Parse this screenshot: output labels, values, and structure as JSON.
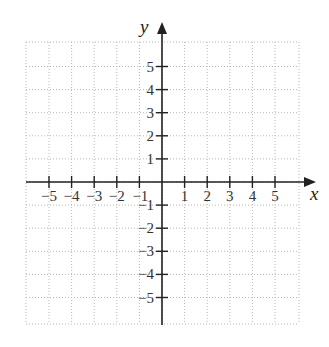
{
  "chart_data": {
    "type": "scatter",
    "title": "",
    "xlabel": "x",
    "ylabel": "y",
    "xlim": [
      -6,
      6
    ],
    "ylim": [
      -6,
      6
    ],
    "grid": true,
    "grid_style": "dotted",
    "x_ticks": [
      -5,
      -4,
      -3,
      -2,
      -1,
      1,
      2,
      3,
      4,
      5
    ],
    "y_ticks": [
      -5,
      -4,
      -3,
      -2,
      -1,
      1,
      2,
      3,
      4,
      5
    ],
    "x_tick_labels": [
      "−5",
      "−4",
      "−3",
      "−2",
      "−1",
      "1",
      "2",
      "3",
      "4",
      "5"
    ],
    "y_tick_labels": [
      "−5",
      "−4",
      "−3",
      "−2",
      "−1",
      "1",
      "2",
      "3",
      "4",
      "5"
    ],
    "series": [],
    "legend": null
  },
  "colors": {
    "axis": "#222222",
    "grid": "#b8b8b8",
    "background": "#ffffff"
  }
}
